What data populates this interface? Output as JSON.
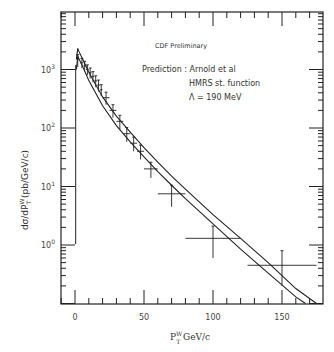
{
  "chart_data": {
    "type": "scatter",
    "title": "CDF Preliminary",
    "annotations": [
      "Prediction : Arnold et al",
      "HMRS st. function",
      "Λ = 190 MeV"
    ],
    "xlabel": "P_T^W GeV/c",
    "ylabel": "dσ/dP_T^W (pb/GeV/c)",
    "xlim": [
      -10,
      180
    ],
    "ylim": [
      0.1,
      8000
    ],
    "yscale": "log",
    "x_ticks": [
      "0",
      "50",
      "100",
      "150"
    ],
    "y_ticks": [
      "10^0",
      "10^1",
      "10^2",
      "10^3"
    ],
    "grid": false,
    "series": [
      {
        "name": "CDF data",
        "points": [
          {
            "x": 2,
            "y": 1500,
            "xerr": 1,
            "yerr_lo": 400,
            "yerr_hi": 300
          },
          {
            "x": 5,
            "y": 1300,
            "xerr": 1,
            "yerr_lo": 250,
            "yerr_hi": 250
          },
          {
            "x": 7,
            "y": 1150,
            "xerr": 1,
            "yerr_lo": 230,
            "yerr_hi": 230
          },
          {
            "x": 9,
            "y": 1000,
            "xerr": 1,
            "yerr_lo": 200,
            "yerr_hi": 200
          },
          {
            "x": 11,
            "y": 880,
            "xerr": 1,
            "yerr_lo": 180,
            "yerr_hi": 180
          },
          {
            "x": 13,
            "y": 760,
            "xerr": 1,
            "yerr_lo": 160,
            "yerr_hi": 160
          },
          {
            "x": 15,
            "y": 640,
            "xerr": 1,
            "yerr_lo": 140,
            "yerr_hi": 140
          },
          {
            "x": 17,
            "y": 540,
            "xerr": 1,
            "yerr_lo": 120,
            "yerr_hi": 120
          },
          {
            "x": 19,
            "y": 450,
            "xerr": 1,
            "yerr_lo": 100,
            "yerr_hi": 100
          },
          {
            "x": 22.5,
            "y": 330,
            "xerr": 2.5,
            "yerr_lo": 80,
            "yerr_hi": 80
          },
          {
            "x": 27.5,
            "y": 200,
            "xerr": 2.5,
            "yerr_lo": 50,
            "yerr_hi": 50
          },
          {
            "x": 32.5,
            "y": 130,
            "xerr": 2.5,
            "yerr_lo": 35,
            "yerr_hi": 35
          },
          {
            "x": 37.5,
            "y": 80,
            "xerr": 2.5,
            "yerr_lo": 22,
            "yerr_hi": 22
          },
          {
            "x": 42.5,
            "y": 55,
            "xerr": 2.5,
            "yerr_lo": 15,
            "yerr_hi": 15
          },
          {
            "x": 47.5,
            "y": 40,
            "xerr": 2.5,
            "yerr_lo": 11,
            "yerr_hi": 11
          },
          {
            "x": 55,
            "y": 20,
            "xerr": 5,
            "yerr_lo": 6,
            "yerr_hi": 6
          },
          {
            "x": 70,
            "y": 7.5,
            "xerr": 10,
            "yerr_lo": 3,
            "yerr_hi": 3
          },
          {
            "x": 100,
            "y": 1.3,
            "xerr": 20,
            "yerr_lo": 0.7,
            "yerr_hi": 0.8
          },
          {
            "x": 150,
            "y": 0.45,
            "xerr": 25,
            "yerr_lo": 0.25,
            "yerr_hi": 0.35
          }
        ]
      },
      {
        "name": "Prediction upper band",
        "type": "line",
        "x": [
          1,
          2,
          3,
          5,
          10,
          20,
          30,
          40,
          50,
          60,
          70,
          80,
          100,
          120,
          140,
          160,
          175
        ],
        "y": [
          1500,
          2300,
          2000,
          1600,
          900,
          340,
          160,
          85,
          46,
          26,
          15,
          9,
          3.3,
          1.3,
          0.5,
          0.18,
          0.1
        ]
      },
      {
        "name": "Prediction lower band",
        "type": "line",
        "x": [
          1,
          2,
          3,
          5,
          10,
          20,
          30,
          40,
          50,
          60,
          70,
          80,
          100,
          120,
          140,
          160,
          167
        ],
        "y": [
          1000,
          1700,
          1500,
          1200,
          650,
          240,
          110,
          58,
          32,
          18,
          10.5,
          6.2,
          2.3,
          0.85,
          0.33,
          0.13,
          0.1
        ]
      }
    ]
  }
}
